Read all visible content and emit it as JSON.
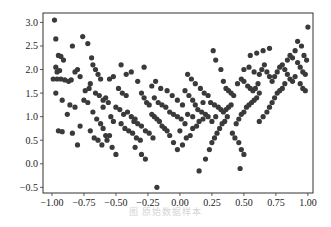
{
  "figure": {
    "caption": "图      原始数据样本"
  },
  "chart_data": {
    "type": "scatter",
    "title": "",
    "xlabel": "",
    "ylabel": "",
    "xlim": [
      -1.07,
      1.04
    ],
    "ylim": [
      -0.62,
      3.2
    ],
    "grid": false,
    "legend": null,
    "marker_color": "#3a3a3a",
    "x_ticks": [
      -1.0,
      -0.75,
      -0.5,
      -0.25,
      0.0,
      0.25,
      0.5,
      0.75,
      1.0
    ],
    "x_tick_labels": [
      "−1.00",
      "−0.75",
      "−0.50",
      "−0.25",
      "0.00",
      "0.25",
      "0.50",
      "0.75",
      "1.00"
    ],
    "y_ticks": [
      -0.5,
      0.0,
      0.5,
      1.0,
      1.5,
      2.0,
      2.5,
      3.0
    ],
    "y_tick_labels": [
      "−0.5",
      "0.0",
      "0.5",
      "1.0",
      "1.5",
      "2.0",
      "2.5",
      "3.0"
    ],
    "points": [
      [
        -0.98,
        3.05
      ],
      [
        -0.97,
        2.65
      ],
      [
        -0.95,
        2.3
      ],
      [
        -0.93,
        2.28
      ],
      [
        -0.91,
        2.2
      ],
      [
        -0.97,
        2.05
      ],
      [
        -0.96,
        1.95
      ],
      [
        -0.94,
        1.98
      ],
      [
        -0.99,
        1.8
      ],
      [
        -0.96,
        1.8
      ],
      [
        -0.93,
        1.8
      ],
      [
        -0.9,
        1.78
      ],
      [
        -0.87,
        1.75
      ],
      [
        -0.85,
        1.78
      ],
      [
        -0.97,
        1.5
      ],
      [
        -0.92,
        1.35
      ],
      [
        -0.88,
        1.05
      ],
      [
        -0.86,
        1.25
      ],
      [
        -0.82,
        1.2
      ],
      [
        -0.95,
        0.7
      ],
      [
        -0.92,
        0.68
      ],
      [
        -0.84,
        0.65
      ],
      [
        -0.8,
        0.4
      ],
      [
        -0.78,
        0.8
      ],
      [
        -0.84,
        2.5
      ],
      [
        -0.76,
        2.7
      ],
      [
        -0.72,
        2.55
      ],
      [
        -0.69,
        2.25
      ],
      [
        -0.68,
        2.1
      ],
      [
        -0.66,
        2.0
      ],
      [
        -0.64,
        1.9
      ],
      [
        -0.62,
        1.8
      ],
      [
        -0.74,
        1.55
      ],
      [
        -0.71,
        1.6
      ],
      [
        -0.7,
        1.7
      ],
      [
        -0.66,
        1.5
      ],
      [
        -0.63,
        1.45
      ],
      [
        -0.6,
        1.35
      ],
      [
        -0.58,
        1.4
      ],
      [
        -0.56,
        1.3
      ],
      [
        -0.75,
        1.35
      ],
      [
        -0.72,
        1.3
      ],
      [
        -0.68,
        1.1
      ],
      [
        -0.65,
        0.95
      ],
      [
        -0.62,
        0.85
      ],
      [
        -0.6,
        0.75
      ],
      [
        -0.58,
        0.6
      ],
      [
        -0.55,
        0.6
      ],
      [
        -0.7,
        0.7
      ],
      [
        -0.67,
        0.55
      ],
      [
        -0.64,
        0.5
      ],
      [
        -0.61,
        0.4
      ],
      [
        -0.57,
        0.5
      ],
      [
        -0.53,
        0.35
      ],
      [
        -0.5,
        0.2
      ],
      [
        -0.55,
        1.8
      ],
      [
        -0.52,
        1.85
      ],
      [
        -0.48,
        1.6
      ],
      [
        -0.45,
        1.5
      ],
      [
        -0.42,
        1.45
      ],
      [
        -0.5,
        1.2
      ],
      [
        -0.47,
        1.15
      ],
      [
        -0.44,
        1.05
      ],
      [
        -0.41,
        1.1
      ],
      [
        -0.38,
        1.0
      ],
      [
        -0.35,
        0.95
      ],
      [
        -0.46,
        0.85
      ],
      [
        -0.43,
        0.75
      ],
      [
        -0.4,
        0.7
      ],
      [
        -0.37,
        0.65
      ],
      [
        -0.34,
        0.55
      ],
      [
        -0.31,
        0.5
      ],
      [
        -0.46,
        2.1
      ],
      [
        -0.42,
        1.9
      ],
      [
        -0.38,
        1.95
      ],
      [
        -0.33,
        1.75
      ],
      [
        -0.3,
        1.5
      ],
      [
        -0.28,
        1.4
      ],
      [
        -0.26,
        1.3
      ],
      [
        -0.24,
        1.25
      ],
      [
        -0.36,
        0.9
      ],
      [
        -0.33,
        0.85
      ],
      [
        -0.3,
        0.8
      ],
      [
        -0.27,
        0.7
      ],
      [
        -0.24,
        0.65
      ],
      [
        -0.21,
        0.55
      ],
      [
        -0.35,
        0.35
      ],
      [
        -0.3,
        0.2
      ],
      [
        -0.27,
        0.1
      ],
      [
        -0.22,
        1.05
      ],
      [
        -0.2,
        1.0
      ],
      [
        -0.18,
        0.95
      ],
      [
        -0.16,
        0.9
      ],
      [
        -0.14,
        0.8
      ],
      [
        -0.12,
        0.75
      ],
      [
        -0.1,
        0.7
      ],
      [
        -0.2,
        1.4
      ],
      [
        -0.17,
        1.3
      ],
      [
        -0.14,
        1.25
      ],
      [
        -0.11,
        1.2
      ],
      [
        -0.08,
        1.1
      ],
      [
        -0.05,
        1.05
      ],
      [
        -0.02,
        1.0
      ],
      [
        0.01,
        0.95
      ],
      [
        -0.19,
        1.75
      ],
      [
        -0.15,
        1.6
      ],
      [
        -0.1,
        1.55
      ],
      [
        -0.06,
        1.45
      ],
      [
        -0.02,
        1.35
      ],
      [
        0.02,
        1.25
      ],
      [
        -0.18,
        -0.5
      ],
      [
        -0.05,
        0.45
      ],
      [
        -0.02,
        0.3
      ],
      [
        0.02,
        0.4
      ],
      [
        0.05,
        0.55
      ],
      [
        0.08,
        0.6
      ],
      [
        0.1,
        0.75
      ],
      [
        0.13,
        0.8
      ],
      [
        0.15,
        0.9
      ],
      [
        0.18,
        0.95
      ],
      [
        0.04,
        1.55
      ],
      [
        0.07,
        1.45
      ],
      [
        0.1,
        1.35
      ],
      [
        0.12,
        1.25
      ],
      [
        0.14,
        1.15
      ],
      [
        0.17,
        1.1
      ],
      [
        0.2,
        1.05
      ],
      [
        0.22,
        1.0
      ],
      [
        0.06,
        1.9
      ],
      [
        0.09,
        1.8
      ],
      [
        0.12,
        1.7
      ],
      [
        0.16,
        1.6
      ],
      [
        0.19,
        1.5
      ],
      [
        0.22,
        1.45
      ],
      [
        0.15,
        -0.15
      ],
      [
        0.2,
        0.1
      ],
      [
        0.23,
        0.3
      ],
      [
        0.25,
        0.45
      ],
      [
        0.27,
        0.55
      ],
      [
        0.29,
        0.65
      ],
      [
        0.31,
        0.75
      ],
      [
        0.33,
        0.85
      ],
      [
        0.35,
        0.9
      ],
      [
        0.37,
        1.0
      ],
      [
        0.24,
        1.3
      ],
      [
        0.27,
        1.25
      ],
      [
        0.3,
        1.2
      ],
      [
        0.32,
        1.15
      ],
      [
        0.34,
        1.1
      ],
      [
        0.36,
        1.15
      ],
      [
        0.38,
        1.2
      ],
      [
        0.4,
        1.25
      ],
      [
        0.26,
        2.4
      ],
      [
        0.28,
        2.2
      ],
      [
        0.32,
        2.0
      ],
      [
        0.34,
        1.75
      ],
      [
        0.36,
        1.6
      ],
      [
        0.38,
        1.55
      ],
      [
        0.4,
        1.5
      ],
      [
        0.42,
        1.45
      ],
      [
        0.41,
        0.65
      ],
      [
        0.43,
        0.55
      ],
      [
        0.46,
        0.45
      ],
      [
        0.48,
        0.3
      ],
      [
        0.5,
        0.2
      ],
      [
        0.47,
        -0.1
      ],
      [
        0.44,
        0.85
      ],
      [
        0.46,
        0.95
      ],
      [
        0.48,
        1.05
      ],
      [
        0.5,
        1.1
      ],
      [
        0.52,
        1.2
      ],
      [
        0.54,
        1.25
      ],
      [
        0.56,
        1.3
      ],
      [
        0.58,
        1.35
      ],
      [
        0.6,
        1.4
      ],
      [
        0.62,
        1.5
      ],
      [
        0.45,
        1.7
      ],
      [
        0.48,
        1.8
      ],
      [
        0.5,
        1.75
      ],
      [
        0.53,
        1.65
      ],
      [
        0.55,
        1.6
      ],
      [
        0.57,
        1.55
      ],
      [
        0.59,
        1.6
      ],
      [
        0.61,
        1.7
      ],
      [
        0.5,
        2.0
      ],
      [
        0.54,
        2.05
      ],
      [
        0.58,
        1.95
      ],
      [
        0.62,
        1.9
      ],
      [
        0.64,
        2.0
      ],
      [
        0.66,
        2.1
      ],
      [
        0.68,
        1.95
      ],
      [
        0.7,
        1.85
      ],
      [
        0.55,
        2.3
      ],
      [
        0.6,
        2.35
      ],
      [
        0.65,
        2.4
      ],
      [
        0.7,
        2.45
      ],
      [
        0.62,
        0.9
      ],
      [
        0.65,
        1.0
      ],
      [
        0.68,
        1.1
      ],
      [
        0.7,
        1.2
      ],
      [
        0.72,
        1.3
      ],
      [
        0.74,
        1.4
      ],
      [
        0.76,
        1.5
      ],
      [
        0.78,
        1.55
      ],
      [
        0.8,
        1.6
      ],
      [
        0.82,
        1.7
      ],
      [
        0.72,
        1.75
      ],
      [
        0.74,
        1.85
      ],
      [
        0.76,
        1.95
      ],
      [
        0.78,
        2.05
      ],
      [
        0.8,
        2.1
      ],
      [
        0.82,
        2.0
      ],
      [
        0.84,
        1.9
      ],
      [
        0.86,
        1.8
      ],
      [
        0.88,
        1.75
      ],
      [
        0.9,
        1.85
      ],
      [
        0.84,
        2.2
      ],
      [
        0.86,
        2.3
      ],
      [
        0.88,
        2.25
      ],
      [
        0.9,
        2.4
      ],
      [
        0.92,
        2.15
      ],
      [
        0.94,
        2.05
      ],
      [
        0.96,
        1.95
      ],
      [
        0.98,
        1.9
      ],
      [
        0.92,
        2.6
      ],
      [
        0.95,
        2.5
      ],
      [
        0.97,
        2.3
      ],
      [
        0.99,
        2.2
      ],
      [
        1.0,
        2.9
      ],
      [
        0.94,
        1.7
      ],
      [
        0.96,
        1.6
      ],
      [
        0.98,
        1.55
      ],
      [
        -0.82,
        1.95
      ],
      [
        -0.8,
        2.0
      ],
      [
        -0.78,
        1.85
      ],
      [
        -0.6,
        1.2
      ],
      [
        -0.54,
        1.0
      ],
      [
        -0.52,
        0.9
      ],
      [
        -0.28,
        2.05
      ],
      [
        -0.22,
        1.65
      ],
      [
        -0.08,
        0.6
      ],
      [
        0.0,
        0.7
      ],
      [
        0.04,
        0.85
      ],
      [
        0.06,
        1.05
      ],
      [
        0.1,
        1.0
      ],
      [
        0.18,
        1.3
      ],
      [
        0.25,
        0.9
      ],
      [
        0.28,
        1.0
      ]
    ]
  }
}
